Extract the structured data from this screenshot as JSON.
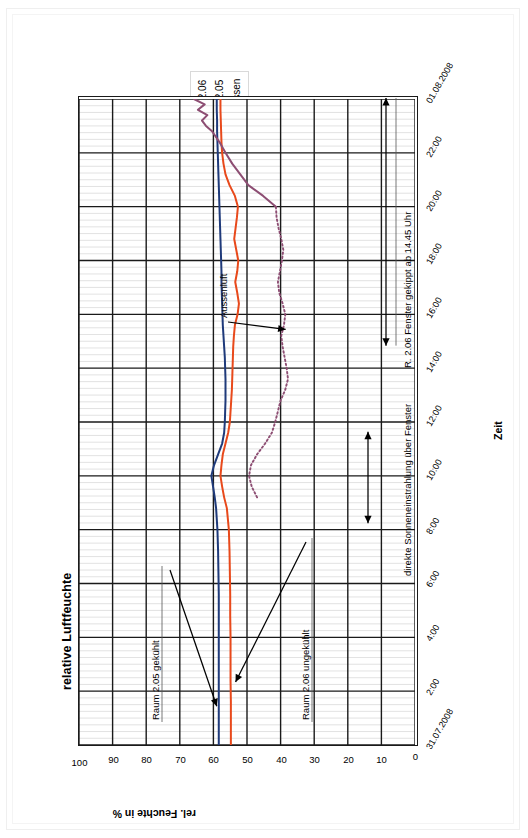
{
  "chart_data": {
    "type": "line",
    "title": "relative Luftfeuchte",
    "xlabel": "Zeit",
    "ylabel": "rel. Feuchte in %",
    "ylim": [
      0,
      100
    ],
    "ytick_labels": [
      "0",
      "10",
      "20",
      "30",
      "40",
      "50",
      "60",
      "70",
      "80",
      "90",
      "100"
    ],
    "ytick_values": [
      0,
      10,
      20,
      30,
      40,
      50,
      60,
      70,
      80,
      90,
      100
    ],
    "xtick_labels": [
      "31.07.2008",
      "2:00",
      "4:00",
      "6:00",
      "8:00",
      "10:00",
      "12:00",
      "14:00",
      "16:00",
      "18:00",
      "20:00",
      "22:00",
      "01.08.2008"
    ],
    "xtick_hours": [
      0,
      2,
      4,
      6,
      8,
      10,
      12,
      14,
      16,
      18,
      20,
      22,
      24
    ],
    "grid": true,
    "legend_position": "top-right",
    "series": [
      {
        "name": "R. 2.06",
        "color": "#E8491B",
        "style": "solid",
        "x": [
          0,
          0.8,
          1.6,
          2.4,
          3.2,
          4.0,
          4.8,
          5.6,
          6.4,
          7.2,
          8.0,
          8.8,
          9.2,
          9.6,
          10.0,
          10.4,
          10.8,
          11.2,
          11.6,
          12.0,
          12.4,
          12.8,
          13.2,
          13.6,
          14.0,
          14.4,
          14.8,
          15.2,
          15.6,
          16.0,
          16.4,
          16.8,
          17.2,
          17.6,
          18.0,
          18.4,
          18.8,
          19.2,
          19.6,
          20.0,
          20.4,
          20.8,
          21.2,
          21.6,
          22.0,
          22.4,
          22.8,
          23.2,
          23.6,
          24.0
        ],
        "y": [
          54.8,
          54.8,
          54.8,
          54.9,
          54.9,
          54.9,
          55.0,
          55.0,
          55.1,
          55.2,
          55.4,
          56.0,
          56.8,
          57.4,
          57.9,
          57.6,
          57.2,
          56.4,
          55.6,
          55.1,
          54.9,
          54.7,
          54.5,
          54.4,
          54.3,
          54.2,
          54.1,
          53.9,
          53.6,
          52.8,
          52.4,
          52.9,
          53.5,
          52.9,
          52.6,
          53.2,
          53.8,
          53.4,
          53.0,
          52.7,
          53.6,
          55.2,
          56.4,
          57.0,
          57.4,
          57.6,
          57.7,
          57.8,
          57.9,
          57.9
        ]
      },
      {
        "name": "R. 2.05",
        "color": "#1F3A7A",
        "style": "solid",
        "x": [
          0,
          0.8,
          1.6,
          2.4,
          3.2,
          4.0,
          4.8,
          5.6,
          6.4,
          7.2,
          8.0,
          8.8,
          9.2,
          9.6,
          10.0,
          10.4,
          10.8,
          11.2,
          11.6,
          12.0,
          12.4,
          12.8,
          13.2,
          13.6,
          14.0,
          14.4,
          14.8,
          15.2,
          15.6,
          16.0,
          16.4,
          16.8,
          17.2,
          17.6,
          18.0,
          18.4,
          18.8,
          19.2,
          19.6,
          20.0,
          20.4,
          20.8,
          21.2,
          21.6,
          22.0,
          22.4,
          22.8,
          23.2,
          23.6,
          24.0
        ],
        "y": [
          58.4,
          58.4,
          58.4,
          58.4,
          58.4,
          58.4,
          58.4,
          58.4,
          58.5,
          58.6,
          58.8,
          59.2,
          59.6,
          60.1,
          60.6,
          59.8,
          58.6,
          57.4,
          56.8,
          56.6,
          56.5,
          56.4,
          56.4,
          56.4,
          56.5,
          56.6,
          56.8,
          57.0,
          57.2,
          57.3,
          57.4,
          57.5,
          57.6,
          57.6,
          57.7,
          57.8,
          57.9,
          58.0,
          58.1,
          58.2,
          58.3,
          58.4,
          58.5,
          58.6,
          58.7,
          58.8,
          58.9,
          58.9,
          59.0,
          59.0
        ]
      },
      {
        "name": "Aussen",
        "color": "#8D4E73",
        "style": "dotted",
        "x": [
          9.2,
          9.6,
          10.0,
          10.4,
          10.8,
          11.2,
          11.6,
          12.0,
          12.4,
          12.8,
          13.2,
          13.6,
          14.0,
          14.4,
          14.8,
          15.2,
          15.6,
          16.0,
          16.4,
          16.8,
          17.2,
          17.6,
          18.0,
          18.4,
          18.8,
          19.2,
          19.6,
          20.0
        ],
        "y": [
          47.0,
          48.6,
          49.4,
          48.8,
          47.0,
          44.6,
          42.6,
          41.6,
          40.8,
          40.0,
          38.6,
          37.8,
          38.2,
          38.8,
          39.4,
          39.8,
          39.0,
          38.6,
          39.4,
          40.4,
          40.8,
          40.2,
          39.6,
          39.2,
          39.8,
          40.6,
          41.2,
          41.4
        ]
      },
      {
        "name": "Aussen-solid",
        "color": "#8D4E73",
        "style": "solid",
        "x": [
          20.0,
          20.4,
          20.8,
          21.2,
          21.6,
          22.0,
          22.4,
          22.8,
          23.0,
          23.2,
          23.4,
          23.6,
          23.8,
          24.0
        ],
        "y": [
          41.4,
          45.2,
          49.6,
          52.0,
          54.4,
          56.4,
          58.2,
          60.4,
          62.2,
          63.4,
          61.8,
          64.6,
          62.6,
          65.8
        ]
      }
    ],
    "annotations": [
      {
        "name": "raum-205-gekuehlt",
        "text": "Raum 2.05 gekühlt",
        "has_arrow": true
      },
      {
        "name": "raum-206-ungekuehlt",
        "text": "Raum 2.06 ungekühlt",
        "has_arrow": true
      },
      {
        "name": "aussenluft",
        "text": "Aussenluft",
        "has_arrow": true
      },
      {
        "name": "sonneneinstrahlung",
        "text": "direkte Sonneneinstrahlung über Fenster",
        "has_arrow": true
      },
      {
        "name": "fenster-gekippt",
        "text": "R. 2.06 Fenster gekippt ab 14.45 Uhr",
        "has_arrow": true
      }
    ]
  }
}
